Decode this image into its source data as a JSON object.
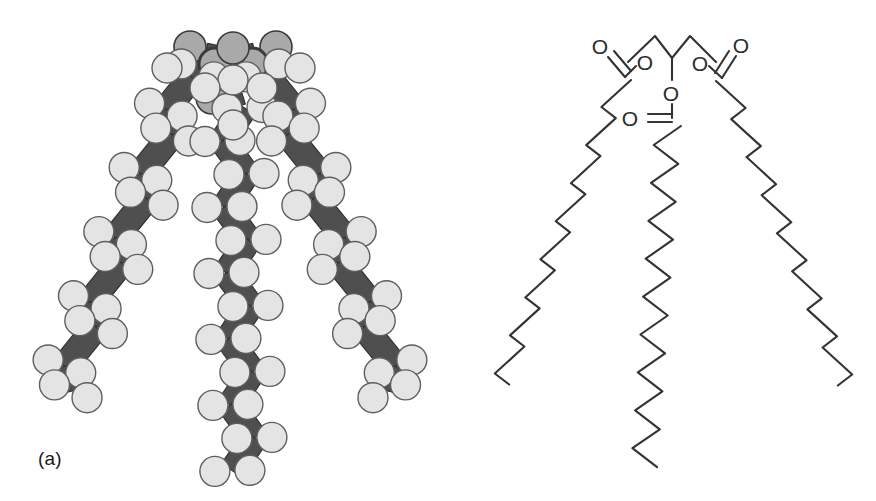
{
  "figure": {
    "background_color": "#ffffff"
  },
  "panels": [
    {
      "id": "a",
      "label": "(a)",
      "caption_label": "(a)",
      "type": "space-filling-model",
      "description": "Tuning-fork shaped triglyceride space filling model with three fatty acid chains",
      "colors": {
        "carbon_sphere_fill": "#e4e4e4",
        "carbon_sphere_stroke": "#5e5e5e",
        "oxygen_sphere_fill": "#a9a9a9",
        "oxygen_sphere_stroke": "#3a3a3a",
        "bond_band_fill": "#4f4f4f",
        "bond_band_stroke": "#2e2e2e"
      },
      "chain_count": 3,
      "chains": [
        {
          "name": "left-chain",
          "direction": "down-left",
          "sphere_pairs": 9
        },
        {
          "name": "middle-chain",
          "direction": "down",
          "sphere_pairs": 10
        },
        {
          "name": "right-chain",
          "direction": "down-right",
          "sphere_pairs": 9
        }
      ],
      "head_group": {
        "name": "glycerol-head",
        "oxygen_count": 6
      }
    },
    {
      "id": "b",
      "label": "(b)",
      "caption_label": "(b)",
      "type": "skeletal-structural-formula",
      "description": "Skeletal formula of a triacylglycerol: glycerol backbone with three ester linked saturated fatty acid zigzag chains",
      "colors": {
        "bond_stroke": "#333333"
      },
      "atom_labels": [
        {
          "name": "carbonyl-oxygen-left",
          "text": "O",
          "x": 600,
          "y": 46
        },
        {
          "name": "ester-oxygen-left",
          "text": "O",
          "x": 645,
          "y": 62
        },
        {
          "name": "ester-oxygen-middle",
          "text": "O",
          "x": 671,
          "y": 93
        },
        {
          "name": "carbonyl-oxygen-middle",
          "text": "O",
          "x": 630,
          "y": 118
        },
        {
          "name": "ester-oxygen-right",
          "text": "O",
          "x": 700,
          "y": 63
        },
        {
          "name": "carbonyl-oxygen-right",
          "text": "O",
          "x": 741,
          "y": 45
        }
      ],
      "ester_groups": 3,
      "chains": [
        {
          "name": "left-acyl-chain",
          "direction": "down-left",
          "zigzag_vertices": 17
        },
        {
          "name": "middle-acyl-chain",
          "direction": "down",
          "zigzag_vertices": 19
        },
        {
          "name": "right-acyl-chain",
          "direction": "down-right",
          "zigzag_vertices": 17
        }
      ]
    }
  ]
}
